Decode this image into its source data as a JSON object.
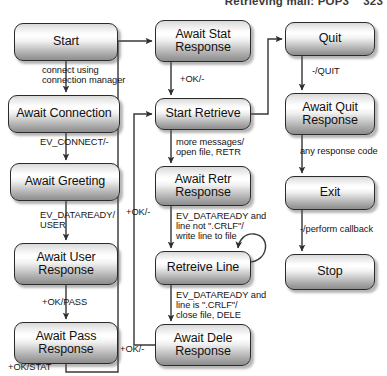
{
  "header": {
    "title": "Retrieving mail: POP3",
    "page_number": "323"
  },
  "diagram": {
    "type": "state-machine",
    "states": [
      {
        "id": "start",
        "label": "Start",
        "column": "left",
        "x": 14,
        "y": 23,
        "w": 104,
        "h": 38
      },
      {
        "id": "await-connection",
        "label": "Await Connection",
        "column": "left",
        "x": 8,
        "y": 95,
        "w": 112,
        "h": 38
      },
      {
        "id": "await-greeting",
        "label": "Await Greeting",
        "column": "left",
        "x": 10,
        "y": 163,
        "w": 110,
        "h": 38
      },
      {
        "id": "await-user-resp",
        "label": "Await User\nResponse",
        "column": "left",
        "x": 14,
        "y": 243,
        "w": 104,
        "h": 42
      },
      {
        "id": "await-pass-resp",
        "label": "Await Pass\nResponse",
        "column": "left",
        "x": 14,
        "y": 322,
        "w": 104,
        "h": 42
      },
      {
        "id": "await-stat-resp",
        "label": "Await Stat\nResponse",
        "column": "middle",
        "x": 155,
        "y": 20,
        "w": 96,
        "h": 42
      },
      {
        "id": "start-retrieve",
        "label": "Start Retrieve",
        "column": "middle",
        "x": 155,
        "y": 98,
        "w": 96,
        "h": 32
      },
      {
        "id": "await-retr-resp",
        "label": "Await Retr\nResponse",
        "column": "middle",
        "x": 155,
        "y": 166,
        "w": 96,
        "h": 40
      },
      {
        "id": "retreive-line",
        "label": "Retreive Line",
        "column": "middle",
        "x": 155,
        "y": 251,
        "w": 96,
        "h": 34
      },
      {
        "id": "await-dele-resp",
        "label": "Await Dele\nResponse",
        "column": "middle",
        "x": 155,
        "y": 324,
        "w": 96,
        "h": 42
      },
      {
        "id": "quit",
        "label": "Quit",
        "column": "right",
        "x": 285,
        "y": 22,
        "w": 90,
        "h": 34
      },
      {
        "id": "await-quit-resp",
        "label": "Await Quit\nResponse",
        "column": "right",
        "x": 285,
        "y": 93,
        "w": 90,
        "h": 42
      },
      {
        "id": "exit",
        "label": "Exit",
        "column": "right",
        "x": 285,
        "y": 176,
        "w": 90,
        "h": 34
      },
      {
        "id": "stop",
        "label": "Stop",
        "column": "right",
        "x": 285,
        "y": 254,
        "w": 90,
        "h": 36
      }
    ],
    "transitions": [
      {
        "id": "t-start-conn",
        "from": "start",
        "to": "await-connection",
        "label": "connect using\nconnection manager",
        "lx": 42,
        "ly": 65
      },
      {
        "id": "t-conn-greet",
        "from": "await-connection",
        "to": "await-greeting",
        "label": "EV_CONNECT/-",
        "lx": 40,
        "ly": 137
      },
      {
        "id": "t-greet-user",
        "from": "await-greeting",
        "to": "await-user-resp",
        "label": "EV_DATAREADY/\nUSER",
        "lx": 40,
        "ly": 210
      },
      {
        "id": "t-user-pass",
        "from": "await-user-resp",
        "to": "await-pass-resp",
        "label": "+OK/PASS",
        "lx": 42,
        "ly": 297
      },
      {
        "id": "t-pass-stat",
        "from": "await-pass-resp",
        "to": "await-stat-resp",
        "label": "+OK/STAT",
        "lx": 8,
        "ly": 362
      },
      {
        "id": "t-stat-retr",
        "from": "await-stat-resp",
        "to": "start-retrieve",
        "label": "+OK/-",
        "lx": 180,
        "ly": 74
      },
      {
        "id": "t-retr-await",
        "from": "start-retrieve",
        "to": "await-retr-resp",
        "label": "more messages/\nopen file, RETR",
        "lx": 175,
        "ly": 138
      },
      {
        "id": "t-await-line",
        "from": "await-retr-resp",
        "to": "retreive-line",
        "label": "EV_DATAREADY and\nline not \".CRLF\"/\nwrite line to file",
        "lx": 175,
        "ly": 212
      },
      {
        "id": "t-line-self",
        "from": "retreive-line",
        "to": "retreive-line",
        "label": "",
        "lx": 0,
        "ly": 0
      },
      {
        "id": "t-line-dele",
        "from": "retreive-line",
        "to": "await-dele-resp",
        "label": "EV_DATAREADY and\nline is \".CRLF\"/\nclose file, DELE",
        "lx": 175,
        "ly": 291
      },
      {
        "id": "t-dele-retr",
        "from": "await-dele-resp",
        "to": "start-retrieve",
        "label": "+OK/-",
        "lx": 122,
        "ly": 345
      },
      {
        "id": "t-retr-quit",
        "from": "start-retrieve",
        "to": "quit",
        "label": "+OK/-",
        "lx": 128,
        "ly": 207
      },
      {
        "id": "t-quit-await",
        "from": "quit",
        "to": "await-quit-resp",
        "label": "-/QUIT",
        "lx": 312,
        "ly": 66
      },
      {
        "id": "t-await-exit",
        "from": "await-quit-resp",
        "to": "exit",
        "label": "any response code",
        "lx": 302,
        "ly": 146
      },
      {
        "id": "t-exit-stop",
        "from": "exit",
        "to": "stop",
        "label": "-/perform callback",
        "lx": 302,
        "ly": 224
      }
    ]
  },
  "colors": {
    "box_outline": "#2b2b2b",
    "box_fill_top": "#ffffff",
    "box_fill_bottom": "#8e8e8e",
    "wire": "#3a3a3a",
    "text": "#111111",
    "header_text": "#3a3a3a",
    "background": "#ffffff"
  }
}
